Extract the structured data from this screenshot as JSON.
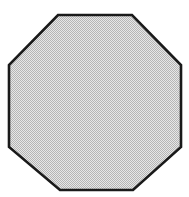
{
  "image": {
    "title": "Octagon",
    "description": "A filled regular octagon outlined in black with a light-gray dithered (halftone) interior on a plain white background.",
    "width": 189,
    "height": 197,
    "background_color": "#ffffff"
  },
  "shape": {
    "name": "octagon",
    "sides": 8,
    "fill_color": "#c9c9c9",
    "fill_style": "dithered-halftone",
    "fill_dither_light": "#ffffff",
    "fill_dither_dark": "#9a9a9a",
    "stroke_color": "#1a1a1a",
    "stroke_width": 2.6,
    "points": "58,15 132,15 181,65 181,147 133,190 60,190 9,147 9,65",
    "vertices": [
      {
        "label": "top-left",
        "x": 58,
        "y": 15
      },
      {
        "label": "top-right",
        "x": 132,
        "y": 15
      },
      {
        "label": "right-top",
        "x": 181,
        "y": 65
      },
      {
        "label": "right-bottom",
        "x": 181,
        "y": 147
      },
      {
        "label": "bottom-right",
        "x": 133,
        "y": 190
      },
      {
        "label": "bottom-left",
        "x": 60,
        "y": 190
      },
      {
        "label": "left-bottom",
        "x": 9,
        "y": 147
      },
      {
        "label": "left-top",
        "x": 9,
        "y": 65
      }
    ],
    "bounding_box": {
      "x": 9,
      "y": 15,
      "width": 172,
      "height": 175
    }
  }
}
